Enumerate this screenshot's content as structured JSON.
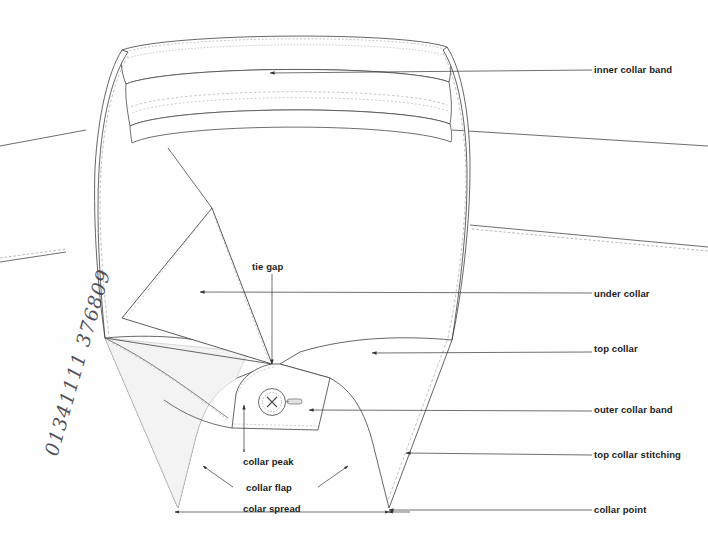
{
  "figure": {
    "background_color": "#fefefe",
    "line_color": "#4a4a4a",
    "shade_color": "#f2f2f2",
    "text_color": "#1c1c1c"
  },
  "handwritten_note": {
    "text": "01341111 376809"
  },
  "callouts_right": [
    {
      "id": "inner-collar-band",
      "label": "inner collar band",
      "label_x": 594,
      "label_y": 64,
      "leader_from_x": 592,
      "leader_from_y": 70,
      "leader_to_x": 270,
      "leader_to_y": 73
    },
    {
      "id": "under-collar",
      "label": "under collar",
      "label_x": 594,
      "label_y": 288,
      "leader_from_x": 592,
      "leader_from_y": 293,
      "leader_to_x": 200,
      "leader_to_y": 292
    },
    {
      "id": "top-collar",
      "label": "top collar",
      "label_x": 594,
      "label_y": 343,
      "leader_from_x": 592,
      "leader_from_y": 352,
      "leader_to_x": 372,
      "leader_to_y": 353
    },
    {
      "id": "outer-collar-band",
      "label": "outer collar band",
      "label_x": 594,
      "label_y": 404,
      "leader_from_x": 592,
      "leader_from_y": 411,
      "leader_to_x": 309,
      "leader_to_y": 410
    },
    {
      "id": "top-collar-stitching",
      "label": "top collar stitching",
      "label_x": 594,
      "label_y": 449,
      "leader_from_x": 592,
      "leader_from_y": 455,
      "leader_to_x": 406,
      "leader_to_y": 453
    },
    {
      "id": "collar-point",
      "label": "collar point",
      "label_x": 594,
      "label_y": 504,
      "leader_from_x": 592,
      "leader_from_y": 510,
      "leader_to_x": 389,
      "leader_to_y": 510
    }
  ],
  "callouts_inner": [
    {
      "id": "tie-gap",
      "label": "tie gap",
      "label_x": 277,
      "label_y": 261,
      "leader_from_x": 272,
      "leader_from_y": 274,
      "leader_to_x": 272,
      "leader_to_y": 364
    },
    {
      "id": "collar-peak",
      "label": "collar peak",
      "label_x": 271,
      "label_y": 456,
      "leader_from_x": 244,
      "leader_from_y": 452,
      "leader_to_x": 244,
      "leader_to_y": 405
    },
    {
      "id": "collar-flap",
      "label": "collar flap",
      "label_x": 274,
      "label_y": 482
    }
  ],
  "flap_arrows": [
    {
      "id": "collar-flap-arrow-left",
      "from_x": 233,
      "from_y": 487,
      "to_x": 203,
      "to_y": 466
    },
    {
      "id": "collar-flap-arrow-right",
      "from_x": 318,
      "from_y": 487,
      "to_x": 348,
      "to_y": 466
    }
  ],
  "dimension": {
    "id": "colar-spread",
    "label": "colar spread",
    "label_x": 277,
    "label_y": 503,
    "line_y": 512,
    "left_x": 175,
    "right_x": 389
  },
  "geometry": {
    "note": "Line-art paths describing the collar; coordinates in the 708x538 viewbox."
  }
}
